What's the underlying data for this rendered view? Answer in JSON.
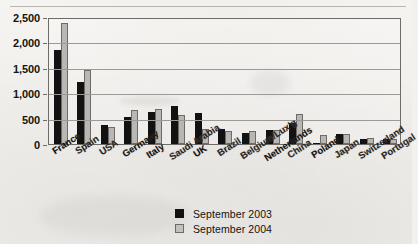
{
  "chart_data": {
    "type": "bar",
    "title": "",
    "xlabel": "",
    "ylabel": "",
    "ylim": [
      0,
      2500
    ],
    "yticks": [
      "0",
      "500",
      "1,000",
      "1,500",
      "2,000",
      "2,500"
    ],
    "grid": true,
    "legend_position": "bottom-center",
    "categories": [
      "France",
      "Spain",
      "USA",
      "Germany",
      "Italy",
      "Saudi Arabia",
      "UK",
      "Brazil",
      "Belgium/Lux'g",
      "Netherlands",
      "China",
      "Poland",
      "Japan",
      "Switzerland",
      "Portugal"
    ],
    "series": [
      {
        "name": "September 2003",
        "color": "#121212",
        "values": [
          1850,
          1220,
          370,
          530,
          640,
          740,
          620,
          290,
          220,
          270,
          420,
          20,
          190,
          100,
          95
        ]
      },
      {
        "name": "September 2004",
        "color": "#b9b7b3",
        "values": [
          2380,
          1450,
          330,
          660,
          680,
          570,
          300,
          250,
          250,
          280,
          590,
          170,
          200,
          110,
          105
        ]
      }
    ]
  },
  "legend": {
    "items": [
      {
        "label": "September 2003",
        "swatch": "black-square-icon"
      },
      {
        "label": "September 2004",
        "swatch": "gray-square-icon"
      }
    ]
  }
}
